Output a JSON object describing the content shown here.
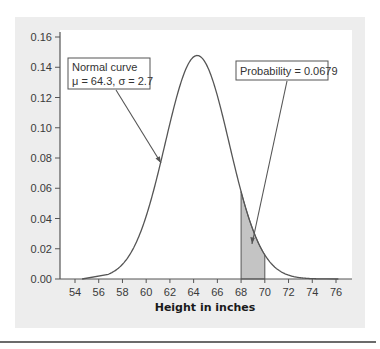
{
  "chart_data": {
    "type": "line",
    "title": "",
    "xlabel": "Height in inches",
    "ylabel": "",
    "distribution": {
      "name": "Normal curve",
      "mean": 64.3,
      "sd": 2.7
    },
    "xlim": [
      53,
      77
    ],
    "ylim": [
      0,
      0.16
    ],
    "x_ticks": [
      54,
      56,
      58,
      60,
      62,
      64,
      66,
      68,
      70,
      72,
      74,
      76
    ],
    "y_ticks": [
      "0.00",
      "0.02",
      "0.04",
      "0.06",
      "0.08",
      "0.10",
      "0.12",
      "0.14",
      "0.16"
    ],
    "shaded_region": {
      "from": 68,
      "to": 70,
      "probability": 0.0679
    },
    "annotations": [
      {
        "id": "curve",
        "lines": [
          "Normal curve",
          "μ = 64.3, σ = 2.7"
        ]
      },
      {
        "id": "prob",
        "lines": [
          "Probability = 0.0679"
        ]
      }
    ],
    "grid": false,
    "colors": {
      "curve": "#555555",
      "shade": "#c4c4c4",
      "panel": "#ededed",
      "plot_bg": "#ffffff"
    }
  },
  "labels": {
    "x_axis_title": "Height in inches",
    "curve_label_line1": "Normal curve",
    "curve_label_line2": "μ = 64.3, σ = 2.7",
    "prob_label": "Probability = 0.0679"
  }
}
